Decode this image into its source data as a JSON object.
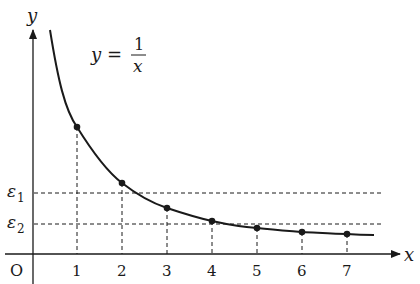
{
  "diagram": {
    "equation": {
      "lhs": "y =",
      "numerator": "1",
      "denominator": "x"
    },
    "axes": {
      "x_label": "x",
      "y_label": "y",
      "origin_label": "O",
      "x_ticks": [
        "1",
        "2",
        "3",
        "4",
        "5",
        "6",
        "7"
      ]
    },
    "thresholds": [
      {
        "label": "ε",
        "subscript": "1"
      },
      {
        "label": "ε",
        "subscript": "2"
      }
    ],
    "points": [
      {
        "x": 1,
        "y": 1
      },
      {
        "x": 2,
        "y": 0.5
      },
      {
        "x": 3,
        "y": 0.333
      },
      {
        "x": 4,
        "y": 0.25
      },
      {
        "x": 5,
        "y": 0.2
      },
      {
        "x": 6,
        "y": 0.167
      },
      {
        "x": 7,
        "y": 0.143
      }
    ],
    "colors": {
      "ink": "#1a1a1a",
      "background": "#ffffff"
    }
  }
}
